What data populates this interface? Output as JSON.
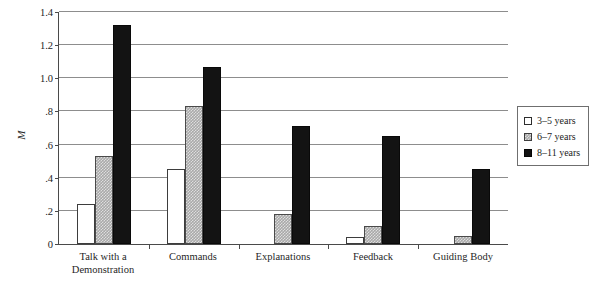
{
  "chart_data": {
    "type": "bar",
    "title": "",
    "xlabel": "",
    "ylabel": "M",
    "ylim": [
      0,
      1.4
    ],
    "grid": true,
    "legend_position": "right",
    "categories": [
      "Talk with a Demonstration",
      "Commands",
      "Explanations",
      "Feedback",
      "Guiding Body"
    ],
    "category_lines": [
      [
        "Talk with a",
        "Demonstration"
      ],
      [
        "Commands",
        ""
      ],
      [
        "Explanations",
        ""
      ],
      [
        "Feedback",
        ""
      ],
      [
        "Guiding Body",
        ""
      ]
    ],
    "series": [
      {
        "name": "3–5 years",
        "values": [
          0.24,
          0.45,
          0.0,
          0.04,
          0.0
        ],
        "color": "#ffffff"
      },
      {
        "name": "6–7 years",
        "values": [
          0.53,
          0.835,
          0.18,
          0.11,
          0.05
        ],
        "color": "#a9a9a9"
      },
      {
        "name": "8–11 years",
        "values": [
          1.32,
          1.07,
          0.71,
          0.65,
          0.455
        ],
        "color": "#131313"
      }
    ],
    "y_ticks": [
      {
        "value": 1.4,
        "label": "1.4"
      },
      {
        "value": 1.2,
        "label": "1.2"
      },
      {
        "value": 1.0,
        "label": "1.0"
      },
      {
        "value": 0.8,
        "label": ".8"
      },
      {
        "value": 0.6,
        "label": ".6"
      },
      {
        "value": 0.4,
        "label": ".4"
      },
      {
        "value": 0.2,
        "label": ".2"
      },
      {
        "value": 0.0,
        "label": "0"
      }
    ]
  },
  "legend": {
    "items": [
      {
        "label": "3–5 years"
      },
      {
        "label": "6–7 years"
      },
      {
        "label": "8–11 years"
      }
    ]
  }
}
